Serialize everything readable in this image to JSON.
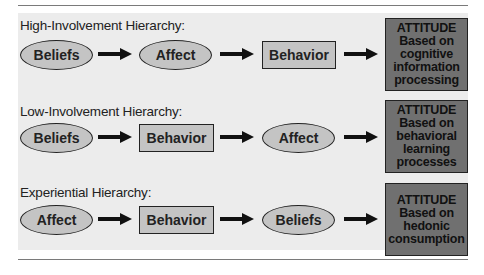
{
  "diagram": {
    "rows": [
      {
        "title": "High-Involvement Hierarchy:",
        "steps": [
          {
            "label": "Beliefs",
            "shape": "ellipse"
          },
          {
            "label": "Affect",
            "shape": "ellipse"
          },
          {
            "label": "Behavior",
            "shape": "rectangle"
          }
        ],
        "outcome": {
          "line1": "ATTITUDE",
          "line2": "Based on",
          "line3": "cognitive",
          "line4": "information",
          "line5": "processing"
        }
      },
      {
        "title": "Low-Involvement Hierarchy:",
        "steps": [
          {
            "label": "Beliefs",
            "shape": "ellipse"
          },
          {
            "label": "Behavior",
            "shape": "rectangle"
          },
          {
            "label": "Affect",
            "shape": "ellipse"
          }
        ],
        "outcome": {
          "line1": "ATTITUDE",
          "line2": "Based on",
          "line3": "behavioral",
          "line4": "learning",
          "line5": "processes"
        }
      },
      {
        "title": "Experiential Hierarchy:",
        "steps": [
          {
            "label": "Affect",
            "shape": "ellipse"
          },
          {
            "label": "Behavior",
            "shape": "rectangle"
          },
          {
            "label": "Beliefs",
            "shape": "ellipse"
          }
        ],
        "outcome": {
          "line1": "ATTITUDE",
          "line2": "Based on",
          "line3": "hedonic",
          "line4": "consumption",
          "line5": ""
        }
      }
    ],
    "colors": {
      "panel": "#ececec",
      "shape_fill": "#c4c4c4",
      "outcome_fill": "#707070",
      "stroke": "#222222"
    },
    "icons": {
      "arrow": "arrow-right-icon"
    }
  }
}
